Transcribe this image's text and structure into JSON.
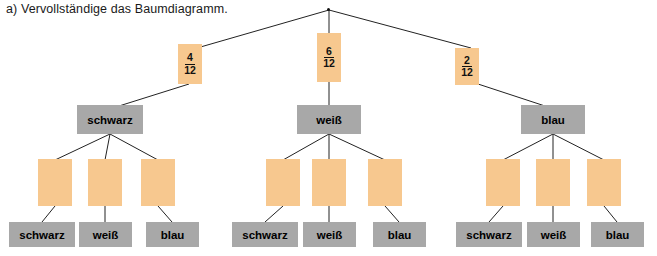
{
  "title": "a) Vervollständige das Baumdiagramm.",
  "diagram": {
    "type": "tree-diagram",
    "colors": {
      "probability_box": "#f7c88f",
      "label_box": "#a8a8a8",
      "line": "#222222",
      "background": "#ffffff"
    },
    "level1_probabilities": [
      {
        "numerator": "4",
        "denominator": "12"
      },
      {
        "numerator": "6",
        "denominator": "12"
      },
      {
        "numerator": "2",
        "denominator": "12"
      }
    ],
    "level1_labels": [
      "schwarz",
      "weiß",
      "blau"
    ],
    "level2_probabilities": [
      {
        "numerator": "",
        "denominator": ""
      },
      {
        "numerator": "",
        "denominator": ""
      },
      {
        "numerator": "",
        "denominator": ""
      },
      {
        "numerator": "",
        "denominator": ""
      },
      {
        "numerator": "",
        "denominator": ""
      },
      {
        "numerator": "",
        "denominator": ""
      },
      {
        "numerator": "",
        "denominator": ""
      },
      {
        "numerator": "",
        "denominator": ""
      },
      {
        "numerator": "",
        "denominator": ""
      }
    ],
    "level2_labels": [
      "schwarz",
      "weiß",
      "blau",
      "schwarz",
      "weiß",
      "blau",
      "schwarz",
      "weiß",
      "blau"
    ]
  }
}
